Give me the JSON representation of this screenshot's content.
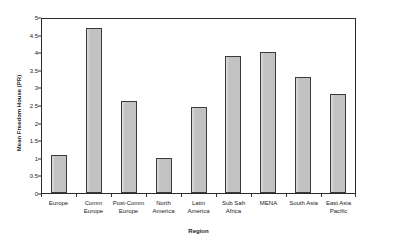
{
  "chart_data": {
    "type": "bar",
    "title": "",
    "xlabel": "Region",
    "ylabel": "Mean Freedom House (PR)",
    "ylim": [
      0,
      5
    ],
    "ytick_step": 0.5,
    "grid": false,
    "legend": null,
    "bar_color": "#c2c2c2",
    "bar_edge_color": "#3a3a3a",
    "axis_color": "#2b2b2b",
    "yticks": [
      "0",
      "0.5",
      "1",
      "1.5",
      "2",
      "2.5",
      "3",
      "3.5",
      "4",
      "4.5",
      "5"
    ],
    "ytick_values": [
      0,
      0.5,
      1,
      1.5,
      2,
      2.5,
      3,
      3.5,
      4,
      4.5,
      5
    ],
    "categories": [
      "Europe",
      "Comm Europe",
      "Post-Comm Europe",
      "North America",
      "Latin America",
      "Sub Sah Africa",
      "MENA",
      "South Asia",
      "East Asia Pacific"
    ],
    "category_lines": [
      [
        "Europe"
      ],
      [
        "Comm",
        "Europe"
      ],
      [
        "Post-Comm",
        "Europe"
      ],
      [
        "North",
        "America"
      ],
      [
        "Latin",
        "America"
      ],
      [
        "Sub Sah",
        "Africa"
      ],
      [
        "MENA"
      ],
      [
        "South Asia"
      ],
      [
        "East Asia",
        "Pacific"
      ]
    ],
    "values": [
      1.08,
      4.68,
      2.62,
      1.0,
      2.45,
      3.9,
      4.0,
      3.3,
      2.8
    ]
  }
}
